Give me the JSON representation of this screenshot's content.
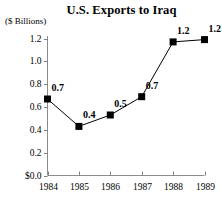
{
  "chart_data": {
    "type": "line",
    "title": "U.S. Exports to Iraq",
    "ylabel": "($ Billions)",
    "xlabel": "",
    "categories": [
      "1984",
      "1985",
      "1986",
      "1987",
      "1988",
      "1989"
    ],
    "values": [
      0.67,
      0.43,
      0.53,
      0.69,
      1.17,
      1.19
    ],
    "point_labels": [
      "0.7",
      "0.4",
      "0.5",
      "0.7",
      "1.2",
      "1.2"
    ],
    "ytick_labels": [
      "1.2",
      "1.0",
      "0.8",
      "0.6",
      "0.4",
      "0.2",
      "$0.0"
    ],
    "ytick_values": [
      1.2,
      1.0,
      0.8,
      0.6,
      0.4,
      0.2,
      0.0
    ],
    "ylim": [
      0.0,
      1.2
    ],
    "grid": false,
    "legend": false,
    "marker": "square",
    "marker_color": "#000000",
    "line_color": "#000000",
    "axis_color": "#808080",
    "background": "#ffffff"
  }
}
